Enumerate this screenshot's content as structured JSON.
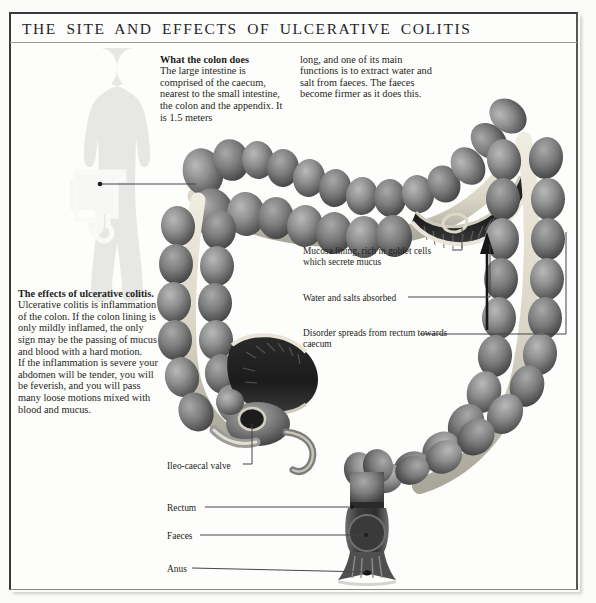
{
  "page": {
    "title": "THE SITE AND EFFECTS OF ULCERATIVE COLITIS",
    "background_color": "#fbfbf9",
    "frame_color": "#3a3a3a",
    "text_color": "#1d1d22"
  },
  "body_text": {
    "what_colon_does": {
      "heading": "What the colon does",
      "column1": "The large intestine is comprised of the caecum, nearest to the small intestine, the colon and the appendix. It is 1.5 meters",
      "column2": "long, and one of its main functions is to extract water and salt from faeces. The faeces become firmer as it does this."
    },
    "effects": {
      "heading": "The effects of ulcerative colitis.",
      "paragraph1": "Ulcerative colitis is inflammation of the colon. If the colon lining is only mildly inflamed, the only sign may be the passing of mucus and blood with a hard motion.",
      "paragraph2": "If the inflammation is severe your abdomen will be tender, you will be feverish, and you will pass many loose motions mixed with blood and mucus."
    }
  },
  "annotations": [
    {
      "id": "mucosa",
      "label": "Mucosa lining, rich in goblet cells which secrete mucus"
    },
    {
      "id": "water",
      "label": "Water and salts absorbed"
    },
    {
      "id": "disorder",
      "label": "Disorder spreads from rectum towards caecum"
    },
    {
      "id": "valve",
      "label": "Ileo-caecal valve"
    },
    {
      "id": "rectum",
      "label": "Rectum"
    },
    {
      "id": "faeces",
      "label": "Faeces"
    },
    {
      "id": "anus",
      "label": "Anus"
    }
  ],
  "illustration": {
    "body_silhouette": "human-body-silhouette",
    "colon_diagram": "large-intestine-colon-cutaway",
    "direction_arrow": "upward-arrow-disorder-spread",
    "silhouette_color": "#e4e4e2",
    "colon_tone_dark": "#4a4a4a",
    "colon_tone_mid": "#8d8d8d",
    "colon_tone_light": "#d8d6cd"
  }
}
